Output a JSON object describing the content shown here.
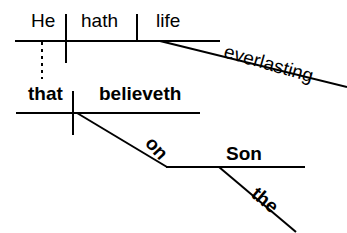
{
  "diagram": {
    "type": "reed-kellogg-sentence-diagram",
    "sentence": "He that believeth on the Son hath everlasting life",
    "stroke_color": "#000000",
    "background_color": "#ffffff",
    "labels": {
      "he": "He",
      "hath": "hath",
      "life": "life",
      "everlasting": "everlasting",
      "that": "that",
      "believeth": "believeth",
      "on": "on",
      "son": "Son",
      "the": "the"
    },
    "lines": {
      "main_baseline": "main-clause-baseline",
      "subject_verb_divider": "subject-verb-divider",
      "verb_object_divider": "verb-object-divider",
      "everlasting_modifier": "adjective-slant-everlasting",
      "relative_clause_baseline": "relative-clause-baseline",
      "relative_subject_verb_divider": "relative-subject-verb-divider",
      "dashed_connector": "relative-pronoun-dashed-connector",
      "on_preposition": "preposition-slant-on",
      "son_object_line": "prepositional-object-line",
      "the_modifier": "article-slant-the"
    }
  }
}
